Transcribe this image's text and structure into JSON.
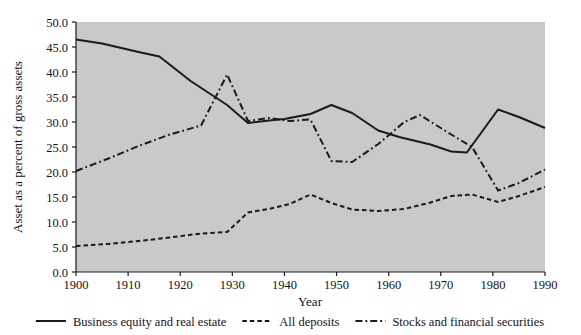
{
  "chart_data": {
    "type": "line",
    "title": "",
    "xlabel": "Year",
    "ylabel": "Asset as a percent of gross assets",
    "xlim": [
      1900,
      1990
    ],
    "ylim": [
      0.0,
      50.0
    ],
    "grid": false,
    "legend_position": "bottom",
    "plot_background": "#c9c9c9",
    "xticks": [
      1900,
      1910,
      1920,
      1930,
      1940,
      1950,
      1960,
      1970,
      1980,
      1990
    ],
    "xtick_labels": [
      "1900",
      "1910",
      "1920",
      "1930",
      "1940",
      "1950",
      "1960",
      "1970",
      "1980",
      "1990"
    ],
    "yticks": [
      0.0,
      5.0,
      10.0,
      15.0,
      20.0,
      25.0,
      30.0,
      35.0,
      40.0,
      45.0,
      50.0
    ],
    "ytick_labels": [
      "0.0",
      "5.0",
      "10.0",
      "15.0",
      "20.0",
      "25.0",
      "30.0",
      "35.0",
      "40.0",
      "45.0",
      "50.0"
    ],
    "series": [
      {
        "name": "Business equity and real estate",
        "style": "solid",
        "color": "#1a1a1a",
        "x": [
          1900,
          1905,
          1912,
          1916,
          1922,
          1929,
          1933,
          1937,
          1940,
          1945,
          1949,
          1953,
          1958,
          1962,
          1968,
          1972,
          1975,
          1981,
          1985,
          1990
        ],
        "y": [
          46.5,
          45.7,
          44.0,
          43.1,
          38.2,
          33.4,
          29.8,
          30.3,
          30.6,
          31.6,
          33.4,
          31.8,
          28.3,
          27.0,
          25.5,
          24.1,
          23.9,
          32.5,
          31.0,
          28.8
        ]
      },
      {
        "name": "All deposits",
        "style": "dashed",
        "color": "#1a1a1a",
        "x": [
          1900,
          1906,
          1912,
          1918,
          1924,
          1929,
          1933,
          1937,
          1941,
          1945,
          1949,
          1953,
          1958,
          1963,
          1968,
          1972,
          1976,
          1981,
          1985,
          1990
        ],
        "y": [
          5.2,
          5.6,
          6.2,
          6.9,
          7.7,
          8.0,
          11.9,
          12.6,
          13.6,
          15.5,
          13.8,
          12.5,
          12.2,
          12.6,
          13.9,
          15.2,
          15.5,
          14.0,
          15.2,
          17.0
        ]
      },
      {
        "name": "Stocks and financial securities",
        "style": "dashdot",
        "color": "#1a1a1a",
        "x": [
          1900,
          1906,
          1912,
          1918,
          1924,
          1929,
          1933,
          1937,
          1941,
          1945,
          1949,
          1953,
          1958,
          1963,
          1966,
          1972,
          1976,
          1981,
          1985,
          1990
        ],
        "y": [
          20.2,
          22.6,
          25.2,
          27.5,
          29.3,
          39.5,
          30.2,
          30.8,
          30.2,
          30.5,
          22.2,
          22.0,
          25.6,
          30.0,
          31.4,
          27.5,
          25.0,
          16.3,
          17.8,
          20.5
        ]
      }
    ],
    "legend": [
      {
        "label": "Business equity and real estate",
        "style": "solid"
      },
      {
        "label": "All deposits",
        "style": "dashed"
      },
      {
        "label": "Stocks and financial securities",
        "style": "dashdot"
      }
    ]
  }
}
